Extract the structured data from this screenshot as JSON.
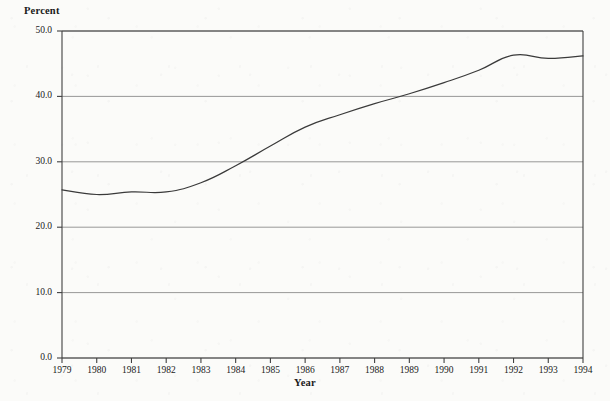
{
  "chart_data": {
    "type": "line",
    "title": "",
    "xlabel": "Year",
    "ylabel": "Percent",
    "categories": [
      "1979",
      "1980",
      "1981",
      "1982",
      "1983",
      "1984",
      "1985",
      "1986",
      "1987",
      "1988",
      "1989",
      "1990",
      "1991",
      "1992",
      "1993",
      "1994"
    ],
    "x": [
      1979,
      1980,
      1981,
      1982,
      1983,
      1984,
      1985,
      1986,
      1987,
      1988,
      1989,
      1990,
      1991,
      1992,
      1993,
      1994
    ],
    "values": [
      25.7,
      25.0,
      25.4,
      25.4,
      26.8,
      29.4,
      32.4,
      35.3,
      37.2,
      38.9,
      40.4,
      42.1,
      44.0,
      46.3,
      45.8,
      46.2
    ],
    "series": [
      {
        "name": "Percent",
        "values": [
          25.7,
          25.0,
          25.4,
          25.4,
          26.8,
          29.4,
          32.4,
          35.3,
          37.2,
          38.9,
          40.4,
          42.1,
          44.0,
          46.3,
          45.8,
          46.2
        ]
      }
    ],
    "ylim": [
      0.0,
      50.0
    ],
    "yticks": [
      0.0,
      10.0,
      20.0,
      30.0,
      40.0,
      50.0
    ],
    "ytick_labels": [
      "0.0",
      "10.0",
      "20.0",
      "30.0",
      "40.0",
      "50.0"
    ],
    "xtick_labels": [
      "1979",
      "1980",
      "1981",
      "1982",
      "1983",
      "1984",
      "1985",
      "1986",
      "1987",
      "1988",
      "1989",
      "1990",
      "1991",
      "1992",
      "1993",
      "1994"
    ],
    "grid": "horizontal",
    "legend": "none",
    "line_color": "#3a3a3a",
    "grid_color": "#8c8c8c",
    "axis_color": "#404040",
    "background_color": "#fbfbf9"
  }
}
